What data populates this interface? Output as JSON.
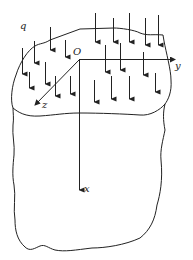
{
  "figure": {
    "type": "elastic half-space with distributed surface load",
    "labels": {
      "load": "q",
      "origin": "O",
      "x_axis": "x",
      "y_axis": "y",
      "z_axis": "z"
    },
    "colors": {
      "line": "#222222",
      "background": "#ffffff"
    },
    "load_arrows": [
      {
        "x": 50,
        "y1": 27,
        "y2": 50
      },
      {
        "x": 34,
        "y1": 41,
        "y2": 63
      },
      {
        "x": 22,
        "y1": 48,
        "y2": 74
      },
      {
        "x": 65,
        "y1": 40,
        "y2": 57
      },
      {
        "x": 95,
        "y1": 13,
        "y2": 42
      },
      {
        "x": 113,
        "y1": 18,
        "y2": 42
      },
      {
        "x": 129,
        "y1": 13,
        "y2": 42
      },
      {
        "x": 145,
        "y1": 18,
        "y2": 45
      },
      {
        "x": 158,
        "y1": 15,
        "y2": 45
      },
      {
        "x": 105,
        "y1": 45,
        "y2": 72
      },
      {
        "x": 120,
        "y1": 43,
        "y2": 70
      },
      {
        "x": 143,
        "y1": 52,
        "y2": 75
      },
      {
        "x": 29,
        "y1": 72,
        "y2": 88
      },
      {
        "x": 45,
        "y1": 62,
        "y2": 84
      },
      {
        "x": 55,
        "y1": 76,
        "y2": 96
      },
      {
        "x": 70,
        "y1": 76,
        "y2": 94
      },
      {
        "x": 94,
        "y1": 80,
        "y2": 102
      },
      {
        "x": 111,
        "y1": 76,
        "y2": 99
      },
      {
        "x": 129,
        "y1": 76,
        "y2": 99
      },
      {
        "x": 155,
        "y1": 73,
        "y2": 92
      }
    ]
  }
}
